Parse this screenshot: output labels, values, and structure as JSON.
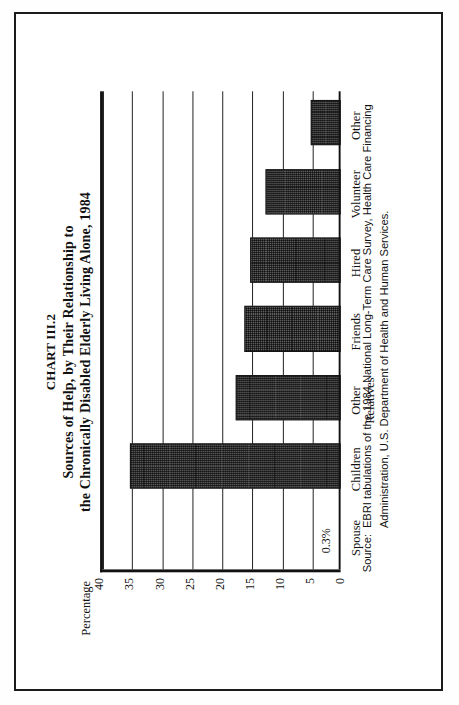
{
  "figure": {
    "chart_number": "CHART III.2",
    "title_line1": "Sources of Help, by Their Relationship to",
    "title_line2": "the Chronically Disabled Elderly Living Alone, 1984"
  },
  "axis": {
    "y_label": "Percentage",
    "y_ticks": [
      "40",
      "35",
      "30",
      "25",
      "20",
      "15",
      "10",
      "5",
      "0"
    ]
  },
  "annotations": {
    "spouse_value_label": "0.3%"
  },
  "source": {
    "label": "Source:",
    "text": "EBRI tabulations of the 1984 National Long-Term Care Survey, Health Care Financing Administration, U.S. Department of Health and Human Services."
  },
  "colors": {
    "bar_fill": "#5d5d5d",
    "ink": "#111111",
    "page": "#ffffff"
  },
  "chart_data": {
    "type": "bar",
    "xlabel": "",
    "ylabel": "Percentage",
    "ylim": [
      0,
      40
    ],
    "ytick_step": 5,
    "grid": true,
    "legend": "none",
    "orientation": "vertical bars printed sideways on the page",
    "categories": [
      "Spouse",
      "Children",
      "Other\nRelatives",
      "Friends",
      "Hired",
      "Volunteer",
      "Other"
    ],
    "category_labels": [
      {
        "line1": "Spouse",
        "line2": ""
      },
      {
        "line1": "Children",
        "line2": ""
      },
      {
        "line1": "Other",
        "line2": "Relatives"
      },
      {
        "line1": "Friends",
        "line2": ""
      },
      {
        "line1": "Hired",
        "line2": ""
      },
      {
        "line1": "Volunteer",
        "line2": ""
      },
      {
        "line1": "Other",
        "line2": ""
      }
    ],
    "values": [
      0.3,
      35,
      17.5,
      16,
      15,
      12.5,
      5
    ],
    "data_labels": [
      "0.3%",
      "",
      "",
      "",
      "",
      "",
      ""
    ]
  }
}
